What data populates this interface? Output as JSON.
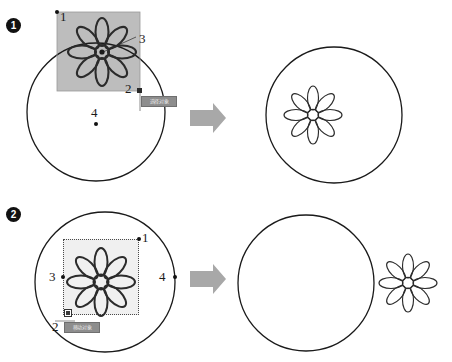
{
  "figure": {
    "type": "instructional-diagram",
    "panel_count": 2
  },
  "panels": [
    {
      "id": "panel-1",
      "step_number": "1",
      "before": {
        "shapes": [
          {
            "name": "circle-outline",
            "cx": 96,
            "cy": 112,
            "r": 69,
            "fill": "none",
            "stroke": "#1a1a1a"
          },
          {
            "name": "flower-motif",
            "cx": 102,
            "cy": 52,
            "petals": 8,
            "state": "selected"
          }
        ],
        "selection_box": {
          "x": 57,
          "y": 12,
          "width": 83,
          "height": 79,
          "fill": "#bdbdbd",
          "style": "solid-gray-overlay"
        },
        "markers": [
          {
            "label": "1",
            "kind": "corner-handle-dot",
            "position": "top-left"
          },
          {
            "label": "2",
            "kind": "corner-handle-square",
            "position": "bottom-right"
          },
          {
            "label": "3",
            "kind": "center-pivot-dot",
            "position": "flower-center",
            "leader_line": true
          },
          {
            "label": "4",
            "kind": "circle-center-dot",
            "position": "circle-center"
          }
        ],
        "tooltip": {
          "text": "选择对象",
          "style": "gray-badge"
        }
      },
      "arrow": {
        "name": "transform-arrow",
        "direction": "right",
        "color": "#a8a8a8"
      },
      "after": {
        "shapes": [
          {
            "name": "circle-outline",
            "cx": 334,
            "cy": 115,
            "r": 68,
            "fill": "none",
            "stroke": "#1a1a1a"
          },
          {
            "name": "flower-motif",
            "cx": 313,
            "cy": 115,
            "petals": 8,
            "state": "placed-inside"
          }
        ]
      }
    },
    {
      "id": "panel-2",
      "step_number": "2",
      "before": {
        "shapes": [
          {
            "name": "circle-outline",
            "cx": 105,
            "cy": 101,
            "r": 70,
            "fill": "none",
            "stroke": "#1a1a1a"
          },
          {
            "name": "flower-motif",
            "cx": 101,
            "cy": 101,
            "petals": 8,
            "state": "selected"
          }
        ],
        "selection_box": {
          "x": 63,
          "y": 58,
          "width": 76,
          "height": 76,
          "fill": "#f0f0f0",
          "style": "dotted-outline"
        },
        "markers": [
          {
            "label": "1",
            "kind": "corner-handle-dot",
            "position": "top-right"
          },
          {
            "label": "2",
            "kind": "corner-handle-square-open",
            "position": "bottom-left"
          },
          {
            "label": "3",
            "kind": "side-handle-dot",
            "position": "left-middle"
          },
          {
            "label": "4",
            "kind": "side-handle-dot",
            "position": "right-of-circle"
          }
        ],
        "tooltip": {
          "text": "移动对象",
          "style": "gray-badge"
        }
      },
      "arrow": {
        "name": "transform-arrow",
        "direction": "right",
        "color": "#a8a8a8"
      },
      "after": {
        "shapes": [
          {
            "name": "circle-outline",
            "cx": 306,
            "cy": 102,
            "r": 68,
            "fill": "none",
            "stroke": "#1a1a1a"
          },
          {
            "name": "flower-motif",
            "cx": 408,
            "cy": 102,
            "petals": 8,
            "state": "moved-outside"
          }
        ]
      }
    }
  ],
  "labels": {
    "p1_marker_1": "1",
    "p1_marker_2": "2",
    "p1_marker_3": "3",
    "p1_marker_4": "4",
    "p2_marker_1": "1",
    "p2_marker_2": "2",
    "p2_marker_3": "3",
    "p2_marker_4": "4",
    "step_1": "1",
    "step_2": "2"
  },
  "colors": {
    "stroke": "#1a1a1a",
    "selection_gray": "#bdbdbd",
    "selection_light": "#f0f0f0",
    "arrow_gray": "#a8a8a8",
    "badge_gray": "#8d8d8d",
    "background": "#ffffff"
  }
}
